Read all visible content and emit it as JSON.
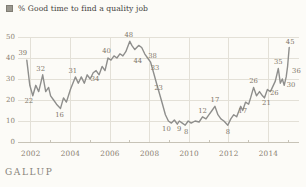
{
  "legend": {
    "label": "% Good time to find a quality job",
    "marker_color": "#9b988f"
  },
  "footer": {
    "brand": "GALLUP"
  },
  "chart_data": {
    "type": "line",
    "title": "% Good time to find a quality job",
    "xlabel": "",
    "ylabel": "",
    "x_ticks": [
      2002,
      2004,
      2006,
      2008,
      2010,
      2012,
      2014
    ],
    "minor_x_ticks": [
      2003,
      2005,
      2007,
      2009,
      2011,
      2013,
      2015
    ],
    "y_ticks": [
      0,
      10,
      20,
      30,
      40,
      50
    ],
    "ylim": [
      0,
      50
    ],
    "xlim": [
      2001.7,
      2015.2
    ],
    "grid": true,
    "legend_position": "top-left",
    "line_color": "#8e8e8c",
    "grid_color": "#e3e0d7",
    "axis_color": "#c7c3b7",
    "points": [
      [
        2001.8,
        39
      ],
      [
        2001.95,
        27
      ],
      [
        2002.1,
        22
      ],
      [
        2002.25,
        27
      ],
      [
        2002.4,
        24
      ],
      [
        2002.6,
        32
      ],
      [
        2002.75,
        24
      ],
      [
        2002.9,
        26
      ],
      [
        2003.0,
        22
      ],
      [
        2003.15,
        20
      ],
      [
        2003.3,
        18
      ],
      [
        2003.5,
        16
      ],
      [
        2003.65,
        21
      ],
      [
        2003.8,
        19
      ],
      [
        2004.0,
        25
      ],
      [
        2004.25,
        31
      ],
      [
        2004.4,
        28
      ],
      [
        2004.55,
        31
      ],
      [
        2004.7,
        28
      ],
      [
        2004.85,
        32
      ],
      [
        2005.0,
        30
      ],
      [
        2005.15,
        33
      ],
      [
        2005.3,
        34
      ],
      [
        2005.45,
        32
      ],
      [
        2005.6,
        36
      ],
      [
        2005.75,
        34
      ],
      [
        2005.9,
        40
      ],
      [
        2006.05,
        39
      ],
      [
        2006.2,
        41
      ],
      [
        2006.35,
        40
      ],
      [
        2006.5,
        42
      ],
      [
        2006.65,
        41
      ],
      [
        2006.8,
        43
      ],
      [
        2007.0,
        48
      ],
      [
        2007.1,
        46
      ],
      [
        2007.25,
        44
      ],
      [
        2007.45,
        46
      ],
      [
        2007.6,
        45
      ],
      [
        2007.75,
        42
      ],
      [
        2007.9,
        40
      ],
      [
        2008.05,
        38
      ],
      [
        2008.2,
        33
      ],
      [
        2008.35,
        28
      ],
      [
        2008.5,
        23
      ],
      [
        2008.65,
        18
      ],
      [
        2008.8,
        13
      ],
      [
        2008.95,
        10
      ],
      [
        2009.1,
        9
      ],
      [
        2009.25,
        10.5
      ],
      [
        2009.4,
        8.5
      ],
      [
        2009.5,
        10
      ],
      [
        2009.65,
        9
      ],
      [
        2009.8,
        8
      ],
      [
        2009.95,
        10
      ],
      [
        2010.1,
        9
      ],
      [
        2010.3,
        10
      ],
      [
        2010.5,
        9.5
      ],
      [
        2010.67,
        12
      ],
      [
        2010.85,
        11
      ],
      [
        2011.0,
        13
      ],
      [
        2011.15,
        15
      ],
      [
        2011.3,
        17
      ],
      [
        2011.45,
        13
      ],
      [
        2011.6,
        11
      ],
      [
        2011.75,
        10
      ],
      [
        2011.95,
        8
      ],
      [
        2012.1,
        11
      ],
      [
        2012.25,
        13
      ],
      [
        2012.4,
        12
      ],
      [
        2012.6,
        17
      ],
      [
        2012.7,
        15
      ],
      [
        2012.85,
        19
      ],
      [
        2013.0,
        18
      ],
      [
        2013.1,
        21
      ],
      [
        2013.25,
        26
      ],
      [
        2013.4,
        22
      ],
      [
        2013.55,
        24
      ],
      [
        2013.7,
        22
      ],
      [
        2013.8,
        21
      ],
      [
        2013.95,
        25
      ],
      [
        2014.1,
        24
      ],
      [
        2014.2,
        26
      ],
      [
        2014.35,
        29
      ],
      [
        2014.5,
        35
      ],
      [
        2014.6,
        28
      ],
      [
        2014.7,
        30
      ],
      [
        2014.8,
        27
      ],
      [
        2014.9,
        31
      ],
      [
        2014.97,
        36
      ],
      [
        2015.05,
        45
      ]
    ],
    "labeled_points": [
      {
        "value": 39,
        "year": 2001.8,
        "pos": "above",
        "dx": -4,
        "dy": -1
      },
      {
        "value": 22,
        "year": 2002.1,
        "pos": "below",
        "dx": -4,
        "dy": -3
      },
      {
        "value": 32,
        "year": 2002.6,
        "pos": "above",
        "dx": -2,
        "dy": 0
      },
      {
        "value": 16,
        "year": 2003.5,
        "pos": "below",
        "dx": -1,
        "dy": -1
      },
      {
        "value": 31,
        "year": 2004.25,
        "pos": "above",
        "dx": -2.5,
        "dy": 0
      },
      {
        "value": 34,
        "year": 2005.3,
        "pos": "below",
        "dx": -1,
        "dy": 0
      },
      {
        "value": 40,
        "year": 2005.9,
        "pos": "above",
        "dx": -1.5,
        "dy": -1
      },
      {
        "value": 48,
        "year": 2007.0,
        "pos": "above",
        "dx": -1,
        "dy": 0
      },
      {
        "value": 44,
        "year": 2007.25,
        "pos": "below",
        "dx": 3,
        "dy": 3
      },
      {
        "value": 38,
        "year": 2008.05,
        "pos": "above",
        "dx": 2,
        "dy": 0
      },
      {
        "value": 33,
        "year": 2008.2,
        "pos": "above",
        "dx": 1.5,
        "dy": 1
      },
      {
        "value": 23,
        "year": 2008.5,
        "pos": "above",
        "dx": -1,
        "dy": 0
      },
      {
        "value": 10,
        "year": 2008.95,
        "pos": "below",
        "dx": -2,
        "dy": 0
      },
      {
        "value": 9,
        "year": 2009.65,
        "pos": "below",
        "dx": -3,
        "dy": -2
      },
      {
        "value": 8,
        "year": 2009.8,
        "pos": "below",
        "dx": 1,
        "dy": -1
      },
      {
        "value": 12,
        "year": 2010.67,
        "pos": "above",
        "dx": 0,
        "dy": 0
      },
      {
        "value": 17,
        "year": 2011.3,
        "pos": "above",
        "dx": 0,
        "dy": 0
      },
      {
        "value": 8,
        "year": 2011.95,
        "pos": "below",
        "dx": 0,
        "dy": -1
      },
      {
        "value": 17,
        "year": 2012.6,
        "pos": "below",
        "dx": 2,
        "dy": -3
      },
      {
        "value": 26,
        "year": 2013.25,
        "pos": "above",
        "dx": 0,
        "dy": 0
      },
      {
        "value": 21,
        "year": 2013.8,
        "pos": "below",
        "dx": 2,
        "dy": -3
      },
      {
        "value": 26,
        "year": 2014.2,
        "pos": "below",
        "dx": 2,
        "dy": -2
      },
      {
        "value": 35,
        "year": 2014.5,
        "pos": "above",
        "dx": 0,
        "dy": -1
      },
      {
        "value": 30,
        "year": 2014.7,
        "pos": "right",
        "dx": 0,
        "dy": 4
      },
      {
        "value": 36,
        "year": 2014.97,
        "pos": "right",
        "dx": 0,
        "dy": 3
      },
      {
        "value": 45,
        "year": 2015.05,
        "pos": "above",
        "dx": 1,
        "dy": 0
      }
    ]
  }
}
